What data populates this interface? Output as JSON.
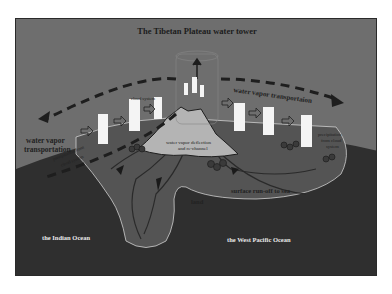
{
  "figure": {
    "title": "The Tibetan Plateau water tower",
    "labels": {
      "cloud_system": "cloud system",
      "water_vapor_transport_left_line1": "water vapor",
      "water_vapor_transport_left_line2": "transportation",
      "water_vapor_transport_right": "water vapor transportaion",
      "deflection_line1": "water vapor deflection",
      "deflection_line2": "and re-channel",
      "precip_left_line1": "precipitation from",
      "precip_left_line2": "cloud system",
      "precip_right_line1": "precipitation",
      "precip_right_line2": "from cloud",
      "precip_right_line3": "system",
      "surface_runoff": "surface run-off to sea",
      "land": "land",
      "indian_ocean": "the Indian Ocean",
      "west_pacific_ocean": "the West Pacific Ocean"
    },
    "colors": {
      "sky": "#6e6e6e",
      "ocean": "#2f2f2f",
      "land": "#555555",
      "plateau": "#b4b4b4",
      "cloud": "#f4f4f4",
      "arrow": "#1e1e1e"
    }
  }
}
